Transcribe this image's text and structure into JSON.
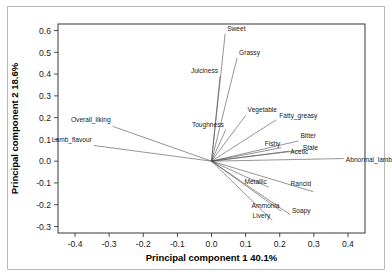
{
  "chart_data": {
    "type": "scatter",
    "title": "",
    "subtitle": "",
    "xlabel": "Principal component 1  40.1%",
    "ylabel": "Principal component 2  18.6%",
    "xlim": [
      -0.45,
      0.45
    ],
    "ylim": [
      -0.33,
      0.63
    ],
    "xticks": [
      "-0.4",
      "-0.3",
      "-0.2",
      "-0.1",
      "0.0",
      "0.1",
      "0.2",
      "0.3",
      "0.4"
    ],
    "xtick_values": [
      -0.4,
      -0.3,
      -0.2,
      -0.1,
      0.0,
      0.1,
      0.2,
      0.3,
      0.4
    ],
    "yticks": [
      "0.6",
      "0.5",
      "0.4",
      "0.3",
      "0.2",
      "0.1",
      "0.0",
      "-0.1",
      "-0.2",
      "-0.3"
    ],
    "ytick_values": [
      0.6,
      0.5,
      0.4,
      0.3,
      0.2,
      0.1,
      0.0,
      -0.1,
      -0.2,
      -0.3
    ],
    "grid": false,
    "legend": "none",
    "origin": [
      0.0,
      0.0
    ],
    "variance_explained": {
      "pc1": "40.1%",
      "pc2": "18.6%"
    },
    "loadings": [
      {
        "name": "Sweet",
        "x": 0.04,
        "y": 0.585,
        "label_dx": 2,
        "label_dy": -3,
        "anchor": "start"
      },
      {
        "name": "Grassy",
        "x": 0.075,
        "y": 0.475,
        "label_dx": 2,
        "label_dy": -3,
        "anchor": "start"
      },
      {
        "name": "Juiciness",
        "x": 0.025,
        "y": 0.39,
        "label_dx": -2,
        "label_dy": -3,
        "anchor": "end"
      },
      {
        "name": "Vegetable",
        "x": 0.1,
        "y": 0.21,
        "label_dx": 2,
        "label_dy": -3,
        "anchor": "start"
      },
      {
        "name": "Fatty_greasy",
        "x": 0.19,
        "y": 0.19,
        "label_dx": 3,
        "label_dy": -2,
        "anchor": "start"
      },
      {
        "name": "Toughness",
        "x": 0.042,
        "y": 0.145,
        "label_dx": -2,
        "label_dy": -3,
        "anchor": "end"
      },
      {
        "name": "Overall_liking",
        "x": -0.29,
        "y": 0.16,
        "label_dx": -2,
        "label_dy": -4,
        "anchor": "end"
      },
      {
        "name": "Lamb_flavour",
        "x": -0.345,
        "y": 0.072,
        "label_dx": -2,
        "label_dy": -3,
        "anchor": "end"
      },
      {
        "name": "Bitter",
        "x": 0.255,
        "y": 0.093,
        "label_dx": 2,
        "label_dy": -3,
        "anchor": "start"
      },
      {
        "name": "Fishy",
        "x": 0.205,
        "y": 0.062,
        "label_dx": -1,
        "label_dy": -2,
        "anchor": "end"
      },
      {
        "name": "Acetic",
        "x": 0.228,
        "y": 0.046,
        "label_dx": 1,
        "label_dy": 3,
        "anchor": "start"
      },
      {
        "name": "Stale",
        "x": 0.262,
        "y": 0.05,
        "label_dx": 2,
        "label_dy": 0,
        "anchor": "start"
      },
      {
        "name": "Abnormal_lamb",
        "x": 0.388,
        "y": 0.012,
        "label_dx": 2,
        "label_dy": 3,
        "anchor": "start"
      },
      {
        "name": "Rancid",
        "x": 0.298,
        "y": -0.14,
        "label_dx": -2,
        "label_dy": -6,
        "anchor": "end"
      },
      {
        "name": "Metallic",
        "x": 0.168,
        "y": -0.12,
        "label_dx": -2,
        "label_dy": -3,
        "anchor": "end"
      },
      {
        "name": "Ammonia",
        "x": 0.205,
        "y": -0.23,
        "label_dx": -2,
        "label_dy": -3,
        "anchor": "end"
      },
      {
        "name": "Soapy",
        "x": 0.23,
        "y": -0.245,
        "label_dx": 2,
        "label_dy": -1,
        "anchor": "start"
      },
      {
        "name": "Livery",
        "x": 0.178,
        "y": -0.272,
        "label_dx": -2,
        "label_dy": -2,
        "anchor": "end"
      }
    ]
  },
  "figure": {
    "background": "#ffffff",
    "line_color": "#4d4d4d",
    "frame_color": "#222222",
    "text_color": "#1a1a1a"
  }
}
